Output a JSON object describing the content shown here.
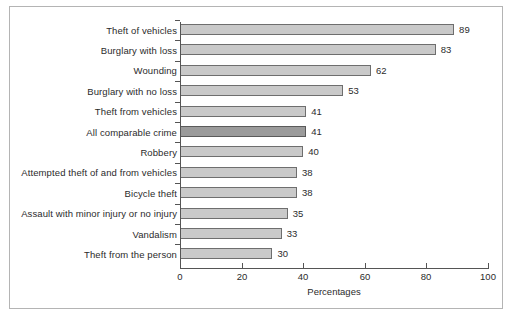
{
  "chart_data": {
    "type": "bar",
    "orientation": "horizontal",
    "title": "",
    "xlabel": "Percentages",
    "ylabel": "",
    "xlim": [
      0,
      100
    ],
    "xticks": [
      0,
      20,
      40,
      60,
      80,
      100
    ],
    "grid": false,
    "legend": null,
    "categories": [
      "Theft of vehicles",
      "Burglary with loss",
      "Wounding",
      "Burglary with no loss",
      "Theft from vehicles",
      "All comparable crime",
      "Robbery",
      "Attempted theft of and from vehicles",
      "Bicycle theft",
      "Assault with minor injury or no injury",
      "Vandalism",
      "Theft from the person"
    ],
    "values": [
      89,
      83,
      62,
      53,
      41,
      41,
      40,
      38,
      38,
      35,
      33,
      30
    ],
    "bar_labels": [
      "89",
      "83",
      "62",
      "53",
      "41",
      "41",
      "40",
      "38",
      "38",
      "35",
      "33",
      "30"
    ],
    "highlight_index": 5,
    "colors": {
      "bar_fill": "#c9c9c9",
      "bar_border": "#6e6e6e",
      "highlight_fill": "#9b9b9b",
      "highlight_border": "#5a5a5a",
      "axis": "#555555",
      "text": "#2b2b2b",
      "frame": "#b4b4b4",
      "background": "#ffffff"
    }
  }
}
